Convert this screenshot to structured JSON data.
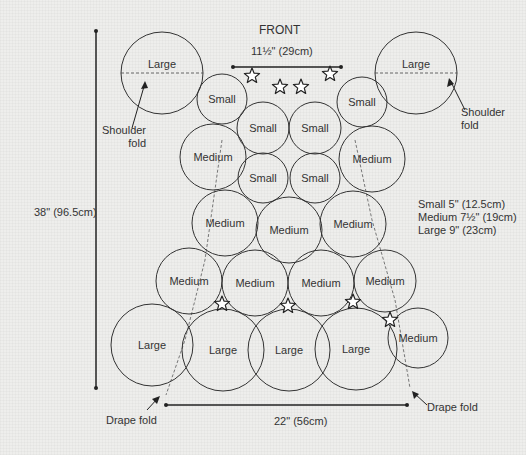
{
  "title": "FRONT",
  "dimensions": {
    "top_width": "11½\" (29cm)",
    "bottom_width": "22\" (56cm)",
    "height": "38\" (96.5cm)"
  },
  "legend": [
    "Small 5\" (12.5cm)",
    "Medium 7½\" (19cm)",
    "Large 9\" (23cm)"
  ],
  "annotations": {
    "shoulder_fold_left": "Shoulder\nfold",
    "shoulder_fold_right": "Shoulder\nfold",
    "drape_fold_left": "Drape fold",
    "drape_fold_right": "Drape fold"
  },
  "circles": [
    {
      "label": "Large",
      "cx": 162,
      "cy": 73,
      "r": 41
    },
    {
      "label": "Large",
      "cx": 416,
      "cy": 73,
      "r": 41
    },
    {
      "label": "Small",
      "cx": 222,
      "cy": 99,
      "r": 25
    },
    {
      "label": "Small",
      "cx": 263,
      "cy": 128,
      "r": 26
    },
    {
      "label": "Small",
      "cx": 315,
      "cy": 128,
      "r": 26
    },
    {
      "label": "Small",
      "cx": 362,
      "cy": 102,
      "r": 25
    },
    {
      "label": "Medium",
      "cx": 213,
      "cy": 157,
      "r": 33
    },
    {
      "label": "Medium",
      "cx": 372,
      "cy": 159,
      "r": 33
    },
    {
      "label": "Small",
      "cx": 263,
      "cy": 178,
      "r": 25
    },
    {
      "label": "Small",
      "cx": 315,
      "cy": 178,
      "r": 25
    },
    {
      "label": "Medium",
      "cx": 225,
      "cy": 223,
      "r": 33
    },
    {
      "label": "Medium",
      "cx": 289,
      "cy": 230,
      "r": 33
    },
    {
      "label": "Medium",
      "cx": 353,
      "cy": 224,
      "r": 33
    },
    {
      "label": "Medium",
      "cx": 189,
      "cy": 281,
      "r": 33
    },
    {
      "label": "Medium",
      "cx": 255,
      "cy": 283,
      "r": 33
    },
    {
      "label": "Medium",
      "cx": 321,
      "cy": 283,
      "r": 33
    },
    {
      "label": "Medium",
      "cx": 385,
      "cy": 281,
      "r": 31
    },
    {
      "label": "Large",
      "cx": 152,
      "cy": 345,
      "r": 41
    },
    {
      "label": "Large",
      "cx": 223,
      "cy": 350,
      "r": 41
    },
    {
      "label": "Large",
      "cx": 289,
      "cy": 350,
      "r": 41
    },
    {
      "label": "Large",
      "cx": 356,
      "cy": 349,
      "r": 41
    },
    {
      "label": "Medium",
      "cx": 418,
      "cy": 338,
      "r": 30
    }
  ],
  "flowers": [
    [
      252,
      76
    ],
    [
      280,
      87
    ],
    [
      301,
      87
    ],
    [
      330,
      74
    ],
    [
      222,
      304
    ],
    [
      288,
      306
    ],
    [
      353,
      302
    ],
    [
      390,
      320
    ]
  ]
}
